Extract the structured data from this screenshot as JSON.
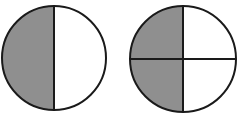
{
  "diagram": {
    "colors": {
      "shaded": "#8f8f8f",
      "unshaded": "#ffffff",
      "stroke": "#1a1a1a"
    },
    "circles": [
      {
        "name": "halves-circle",
        "parts": 2,
        "shaded": 1,
        "cx": 54,
        "cy": 58,
        "r": 52
      },
      {
        "name": "quarters-circle",
        "parts": 4,
        "shaded": 2,
        "cx": 183,
        "cy": 59,
        "r": 53
      }
    ]
  }
}
